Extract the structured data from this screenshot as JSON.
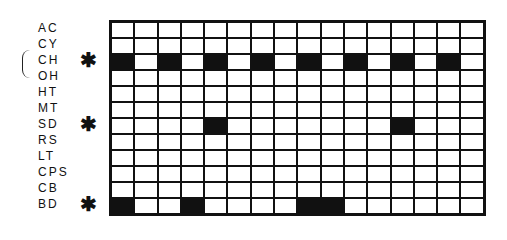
{
  "diagram": {
    "columns": 16,
    "rows": [
      {
        "label": "AC",
        "marked": false,
        "filled": []
      },
      {
        "label": "CY",
        "marked": false,
        "filled": []
      },
      {
        "label": "CH",
        "marked": true,
        "filled": [
          1,
          3,
          5,
          7,
          9,
          11,
          13,
          15
        ]
      },
      {
        "label": "OH",
        "marked": false,
        "filled": []
      },
      {
        "label": "HT",
        "marked": false,
        "filled": []
      },
      {
        "label": "MT",
        "marked": false,
        "filled": []
      },
      {
        "label": "SD",
        "marked": true,
        "filled": [
          5,
          13
        ]
      },
      {
        "label": "RS",
        "marked": false,
        "filled": []
      },
      {
        "label": "LT",
        "marked": false,
        "filled": []
      },
      {
        "label": "CPS",
        "marked": false,
        "filled": []
      },
      {
        "label": "CB",
        "marked": false,
        "filled": []
      },
      {
        "label": "BD",
        "marked": true,
        "filled": [
          1,
          4,
          9,
          10
        ]
      }
    ],
    "marker_symbol": "✱",
    "bracket_rows": [
      "CH",
      "OH"
    ],
    "colors": {
      "filled": "#111111",
      "empty": "#ffffff",
      "line": "#111111"
    }
  }
}
